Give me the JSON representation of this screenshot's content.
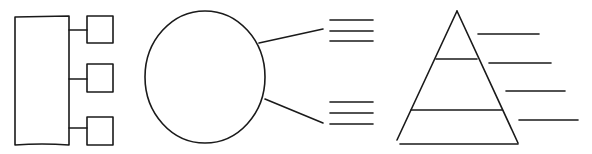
{
  "diagram": {
    "stroke_color": "#1a1a1a",
    "background": "#ffffff",
    "panels": [
      {
        "name": "hierarchy-template",
        "main_box": {
          "x": 15,
          "y": 17,
          "w": 54,
          "h": 128
        },
        "child_boxes": [
          {
            "x": 87,
            "y": 16,
            "w": 26,
            "h": 27,
            "connector_y": 30
          },
          {
            "x": 87,
            "y": 64,
            "w": 26,
            "h": 28,
            "connector_y": 79
          },
          {
            "x": 87,
            "y": 117,
            "w": 26,
            "h": 28,
            "connector_y": 128
          }
        ]
      },
      {
        "name": "circle-callout-template",
        "circle": {
          "cx": 205,
          "cy": 77,
          "rx": 60,
          "ry": 66
        },
        "callouts": [
          {
            "from": [
              259,
              43
            ],
            "to": [
              323,
              29
            ],
            "lines_y": [
              20,
              31,
              41
            ],
            "lines_x": [
              330,
              373
            ]
          },
          {
            "from": [
              265,
              99
            ],
            "to": [
              323,
              123
            ],
            "lines_y": [
              102,
              113,
              124
            ],
            "lines_x": [
              330,
              373
            ]
          }
        ]
      },
      {
        "name": "pyramid-template",
        "apex": [
          457,
          11
        ],
        "base_left": [
          397,
          140
        ],
        "base_right": [
          518,
          143
        ],
        "band_lines": [
          {
            "y": 59,
            "x1": 436,
            "x2": 477
          },
          {
            "y": 110,
            "x1": 411,
            "x2": 502
          }
        ],
        "label_lines": [
          {
            "y": 34,
            "x1": 478,
            "x2": 539
          },
          {
            "y": 63,
            "x1": 489,
            "x2": 551
          },
          {
            "y": 91,
            "x1": 506,
            "x2": 565
          },
          {
            "y": 120,
            "x1": 519,
            "x2": 578
          }
        ]
      }
    ]
  }
}
